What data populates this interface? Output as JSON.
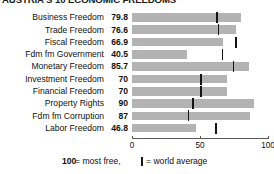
{
  "title": "AUSTRIA'S 10 ECONOMIC FREEDOMS",
  "legend": {
    "most_free_number": "100",
    "most_free_text": "= most free,",
    "average_text": "= world average",
    "average_glyph": "world-average-tick"
  },
  "axis": {
    "ticks": [
      "0",
      "50",
      "100"
    ],
    "min": 0,
    "max": 100
  },
  "colors": {
    "bar": "#b3b3b3",
    "marker": "#161616",
    "axis": "#5a5a5a",
    "text": "#111111",
    "background": "#ffffff"
  },
  "chart_data": {
    "type": "bar",
    "title": "AUSTRIA'S 10 ECONOMIC FREEDOMS",
    "xlabel": "",
    "ylabel": "",
    "xlim": [
      0,
      100
    ],
    "orientation": "horizontal",
    "grid": false,
    "legend_position": "bottom",
    "xticks": [
      0,
      50,
      100
    ],
    "categories": [
      "Business Freedom",
      "Trade Freedom",
      "Fiscal Freedom",
      "Fdm fm Government",
      "Monetary Freedom",
      "Investment Freedom",
      "Financial Freedom",
      "Property Rights",
      "Fdm fm Corruption",
      "Labor Freedom"
    ],
    "series": [
      {
        "name": "Austria score",
        "values": [
          79.8,
          76.6,
          66.9,
          40.5,
          85.7,
          70,
          70,
          90,
          87,
          46.8
        ]
      },
      {
        "name": "World average",
        "type": "marker",
        "values": [
          62,
          63,
          76,
          66,
          74,
          50,
          50,
          44,
          41,
          61
        ]
      }
    ],
    "value_labels": [
      "79.8",
      "76.6",
      "66.9",
      "40.5",
      "85.7",
      "70",
      "70",
      "90",
      "87",
      "46.8"
    ]
  },
  "rows": [
    {
      "label": "Business Freedom",
      "value": "79.8",
      "score": 79.8,
      "average": 62
    },
    {
      "label": "Trade Freedom",
      "value": "76.6",
      "score": 76.6,
      "average": 63
    },
    {
      "label": "Fiscal Freedom",
      "value": "66.9",
      "score": 66.9,
      "average": 76
    },
    {
      "label": "Fdm fm Government",
      "value": "40.5",
      "score": 40.5,
      "average": 66
    },
    {
      "label": "Monetary Freedom",
      "value": "85.7",
      "score": 85.7,
      "average": 74
    },
    {
      "label": "Investment Freedom",
      "value": "70",
      "score": 70,
      "average": 50
    },
    {
      "label": "Financial Freedom",
      "value": "70",
      "score": 70,
      "average": 50
    },
    {
      "label": "Property Rights",
      "value": "90",
      "score": 90,
      "average": 44
    },
    {
      "label": "Fdm fm Corruption",
      "value": "87",
      "score": 87,
      "average": 41
    },
    {
      "label": "Labor Freedom",
      "value": "46.8",
      "score": 46.8,
      "average": 61
    }
  ]
}
